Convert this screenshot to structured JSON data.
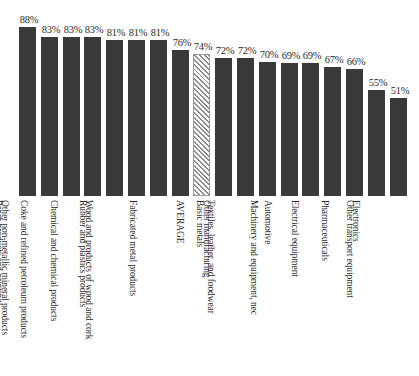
{
  "chart_data": {
    "type": "bar",
    "title": "",
    "subtitle": "",
    "xlabel": "",
    "ylabel": "",
    "ylim": [
      0,
      100
    ],
    "grid": false,
    "legend": "none",
    "value_suffix": "%",
    "categories": [
      "Food, beverages",
      "Paper products and printing",
      "Other non-metallic mineral products",
      "Coke and refined petroleum products",
      "Chemical and chemical products",
      "Rubber and plastics products",
      "Wood and products of wood and cork",
      "Fabricated metal products",
      "AVERAGE",
      "Basic metals",
      "Other manufacturing",
      "Textiles, leather, and foodwear",
      "Automotive",
      "Machinery and equipment, nec",
      "Electrical equipment",
      "Pharmaceuticals",
      "Electronics",
      "Other transport equipment"
    ],
    "values": [
      88,
      83,
      83,
      83,
      81,
      81,
      81,
      76,
      74,
      72,
      72,
      70,
      69,
      69,
      67,
      66,
      55,
      51
    ],
    "value_labels": [
      "88%",
      "83%",
      "83%",
      "83%",
      "81%",
      "81%",
      "81%",
      "76%",
      "74%",
      "72%",
      "72%",
      "70%",
      "69%",
      "69%",
      "67%",
      "66%",
      "55%",
      "51%"
    ],
    "highlight_index": 8,
    "styles": {
      "bar_color": "#3a3a3a",
      "highlight_pattern": "diagonal-hatch",
      "highlight_line_color": "#8a8a8a",
      "background": "#ffffff",
      "text_color": "#2b2b2b"
    }
  }
}
